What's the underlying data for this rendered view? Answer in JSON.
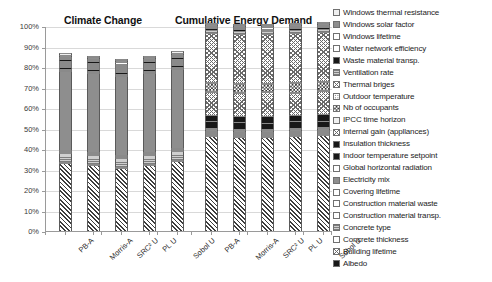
{
  "chart_data": {
    "type": "bar",
    "title": "",
    "subtitle": "",
    "panels": [
      {
        "title": "Climate Change"
      },
      {
        "title": "Cumulative Energy Demand"
      }
    ],
    "xlabel": "",
    "ylabel": "",
    "ylim": [
      0,
      100
    ],
    "yunit": "%",
    "stacked": true,
    "normalized": true,
    "grid": true,
    "legend_position": "right",
    "ytick_labels": [
      "100%",
      "90%",
      "80%",
      "70%",
      "60%",
      "50%",
      "40%",
      "30%",
      "20%",
      "10%",
      "0%"
    ],
    "ytick_values": [
      100,
      90,
      80,
      70,
      60,
      50,
      40,
      30,
      20,
      10,
      0
    ],
    "categories": [
      "PB-A",
      "Morris-A",
      "SRC² U",
      "PL U",
      "Sobol U"
    ],
    "series": [
      {
        "name": "Windows thermal resistance",
        "pattern": "vlight",
        "climate_change": [
          0.8,
          0.8,
          0.8,
          0.8,
          0.8
        ],
        "cumulative_energy_demand": [
          0.7,
          0.7,
          0.7,
          0.7,
          0.7
        ]
      },
      {
        "name": "Windows solar factor",
        "pattern": "midgray",
        "climate_change": [
          1.0,
          1.0,
          1.0,
          1.0,
          1.0
        ],
        "cumulative_energy_demand": [
          1.0,
          1.0,
          1.0,
          1.0,
          1.0
        ]
      },
      {
        "name": "Windows lifetime",
        "pattern": "white",
        "climate_change": [
          0.6,
          0.6,
          0.6,
          0.6,
          0.6
        ],
        "cumulative_energy_demand": [
          0.6,
          0.6,
          0.6,
          0.6,
          0.6
        ]
      },
      {
        "name": "Water network efficiency",
        "pattern": "white",
        "climate_change": [
          0.5,
          0.5,
          0.5,
          0.5,
          0.5
        ],
        "cumulative_energy_demand": [
          0.5,
          0.5,
          0.5,
          0.5,
          0.5
        ]
      },
      {
        "name": "Waste material transp.",
        "pattern": "black",
        "climate_change": [
          0.6,
          0.6,
          0.6,
          0.6,
          0.6
        ],
        "cumulative_energy_demand": [
          0.6,
          0.6,
          0.6,
          0.6,
          0.6
        ]
      },
      {
        "name": "Ventilation rate",
        "pattern": "thingray",
        "climate_change": [
          0.5,
          0.5,
          0.5,
          0.5,
          0.5
        ],
        "cumulative_energy_demand": [
          1.4,
          1.4,
          1.4,
          1.4,
          1.4
        ]
      },
      {
        "name": "Thermal briges",
        "pattern": "crosshatch",
        "climate_change": [
          0.5,
          0.5,
          0.5,
          0.5,
          0.5
        ],
        "cumulative_energy_demand": [
          24.0,
          24.0,
          24.0,
          24.0,
          24.0
        ]
      },
      {
        "name": "Outdoor temperature",
        "pattern": "dots",
        "climate_change": [
          0.5,
          0.5,
          0.5,
          0.5,
          0.5
        ],
        "cumulative_energy_demand": [
          0.6,
          0.6,
          0.6,
          0.6,
          0.6
        ]
      },
      {
        "name": "Nb of occupants",
        "pattern": "checker",
        "climate_change": [
          0.6,
          0.6,
          0.6,
          0.6,
          0.6
        ],
        "cumulative_energy_demand": [
          4.0,
          4.0,
          3.4,
          4.4,
          3.8
        ]
      },
      {
        "name": "IPCC time horizon",
        "pattern": "vlight",
        "climate_change": [
          0.5,
          0.5,
          0.5,
          0.5,
          0.5
        ],
        "cumulative_energy_demand": [
          0.5,
          0.5,
          0.5,
          0.5,
          0.5
        ]
      },
      {
        "name": "Internal gain (appllances)",
        "pattern": "crosshatch",
        "climate_change": [
          0.6,
          0.6,
          0.6,
          0.6,
          0.6
        ],
        "cumulative_energy_demand": [
          11.0,
          11.0,
          11.5,
          10.6,
          11.2
        ]
      },
      {
        "name": "Insulation thickness",
        "pattern": "black",
        "climate_change": [
          0.7,
          0.7,
          0.7,
          0.7,
          0.7
        ],
        "cumulative_energy_demand": [
          3.2,
          3.2,
          3.6,
          3.0,
          3.4
        ]
      },
      {
        "name": "Indoor temperature setpoint",
        "pattern": "black",
        "climate_change": [
          0.6,
          0.6,
          0.6,
          0.6,
          0.6
        ],
        "cumulative_energy_demand": [
          3.4,
          3.4,
          3.0,
          3.6,
          3.2
        ]
      },
      {
        "name": "Global horizontal radiation",
        "pattern": "white",
        "climate_change": [
          0.5,
          0.5,
          0.5,
          0.5,
          0.5
        ],
        "cumulative_energy_demand": [
          0.5,
          0.5,
          0.5,
          0.5,
          0.5
        ]
      },
      {
        "name": "Electricity mix",
        "pattern": "midgray",
        "climate_change": [
          38.5,
          38.5,
          38.5,
          38.5,
          38.5
        ],
        "cumulative_energy_demand": [
          0.6,
          0.6,
          0.6,
          0.6,
          0.6
        ]
      },
      {
        "name": "Covering lifetime",
        "pattern": "white",
        "climate_change": [
          0.5,
          0.5,
          0.5,
          0.5,
          0.5
        ],
        "cumulative_energy_demand": [
          0.5,
          0.5,
          0.5,
          0.5,
          0.5
        ]
      },
      {
        "name": "Construction material waste",
        "pattern": "white",
        "climate_change": [
          0.5,
          0.5,
          0.5,
          0.5,
          0.5
        ],
        "cumulative_energy_demand": [
          0.5,
          0.5,
          0.5,
          0.5,
          0.5
        ]
      },
      {
        "name": "Construction material transp.",
        "pattern": "white",
        "climate_change": [
          0.5,
          0.5,
          0.5,
          0.5,
          0.5
        ],
        "cumulative_energy_demand": [
          0.5,
          0.5,
          0.5,
          0.5,
          0.5
        ]
      },
      {
        "name": "Concrete type",
        "pattern": "thingray",
        "climate_change": [
          4.6,
          4.6,
          4.6,
          4.6,
          4.6
        ],
        "cumulative_energy_demand": [
          0.5,
          0.5,
          0.5,
          0.5,
          0.5
        ]
      },
      {
        "name": "Concrete thickness",
        "pattern": "white",
        "climate_change": [
          0.5,
          0.5,
          0.5,
          0.5,
          0.5
        ],
        "cumulative_energy_demand": [
          0.5,
          0.5,
          0.5,
          0.5,
          0.5
        ]
      },
      {
        "name": "Building lifetime",
        "pattern": "diag",
        "climate_change": [
          33.0,
          32.0,
          30.5,
          32.0,
          34.0
        ],
        "cumulative_energy_demand": [
          46.5,
          46.0,
          46.0,
          46.5,
          47.0
        ]
      },
      {
        "name": "Albedo",
        "pattern": "black",
        "climate_change": [
          0.5,
          0.5,
          0.5,
          0.5,
          0.5
        ],
        "cumulative_energy_demand": [
          0.5,
          0.5,
          0.5,
          0.5,
          0.5
        ]
      }
    ]
  },
  "legend": {
    "items": [
      {
        "label": "Windows thermal resistance",
        "pattern": "vlight"
      },
      {
        "label": "Windows solar factor",
        "pattern": "midgray"
      },
      {
        "label": "Windows lifetime",
        "pattern": "white"
      },
      {
        "label": "Water network efficiency",
        "pattern": "white"
      },
      {
        "label": "Waste material transp.",
        "pattern": "black"
      },
      {
        "label": "Ventilation rate",
        "pattern": "thingray"
      },
      {
        "label": "Thermal briges",
        "pattern": "crosshatch"
      },
      {
        "label": "Outdoor temperature",
        "pattern": "dots"
      },
      {
        "label": "Nb of occupants",
        "pattern": "checker"
      },
      {
        "label": "IPCC time horizon",
        "pattern": "vlight"
      },
      {
        "label": "Internal gain (appllances)",
        "pattern": "crosshatch"
      },
      {
        "label": "Insulation thickness",
        "pattern": "black"
      },
      {
        "label": "Indoor temperature setpoint",
        "pattern": "black"
      },
      {
        "label": "Global horizontal radiation",
        "pattern": "white"
      },
      {
        "label": "Electricity mix",
        "pattern": "midgray"
      },
      {
        "label": "Covering lifetime",
        "pattern": "white"
      },
      {
        "label": "Construction material waste",
        "pattern": "white"
      },
      {
        "label": "Construction material transp.",
        "pattern": "white"
      },
      {
        "label": "Concrete type",
        "pattern": "thingray"
      },
      {
        "label": "Concrete thickness",
        "pattern": "white"
      },
      {
        "label": "Building lifetime",
        "pattern": "crosshatch"
      },
      {
        "label": "Albedo",
        "pattern": "black"
      }
    ]
  }
}
